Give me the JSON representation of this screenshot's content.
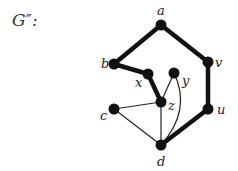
{
  "title": "G″:",
  "nodes": {
    "a": {
      "label": "a",
      "x": 161,
      "y": 25
    },
    "b": {
      "label": "b",
      "x": 114,
      "y": 64
    },
    "v": {
      "label": "v",
      "x": 208,
      "y": 62
    },
    "x": {
      "label": "x",
      "x": 148,
      "y": 74
    },
    "y": {
      "label": "y",
      "x": 174,
      "y": 73
    },
    "z": {
      "label": "z",
      "x": 161,
      "y": 102
    },
    "c": {
      "label": "c",
      "x": 114,
      "y": 109
    },
    "u": {
      "label": "u",
      "x": 208,
      "y": 109
    },
    "d": {
      "label": "d",
      "x": 161,
      "y": 145
    }
  },
  "thick_edges": [
    [
      "a",
      "b"
    ],
    [
      "a",
      "v"
    ],
    [
      "v",
      "u"
    ],
    [
      "u",
      "d"
    ],
    [
      "b",
      "x"
    ],
    [
      "x",
      "z"
    ]
  ],
  "thin_edges": [
    [
      "z",
      "y"
    ],
    [
      "c",
      "z"
    ],
    [
      "c",
      "d"
    ],
    [
      "z",
      "d"
    ],
    [
      "y",
      "d"
    ]
  ],
  "colors": {
    "node": "#111111",
    "edge": "#111111"
  }
}
